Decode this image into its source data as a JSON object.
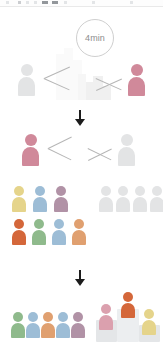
{
  "meta": {
    "background": "#ffffff"
  },
  "toolbar": {
    "visible": true,
    "label": ""
  },
  "palette": {
    "gray_person": "#e3e4e5",
    "gray_person_mid": "#dcdddf",
    "pink": "#d0899a",
    "pink_soft": "#dba0ae",
    "yellow": "#e5d48b",
    "blue": "#9dbdd6",
    "mauve": "#b192a6",
    "orange": "#d4673a",
    "orange_soft": "#de8f55",
    "green": "#8fba8c",
    "tan": "#e0a070",
    "line": "#b6b6b6",
    "arrow": "#1c1c1c",
    "circle_stroke": "#cfcfcf",
    "circle_text": "#8d8d8d",
    "skyline": "#e4e4e4",
    "podium": "#e2e4e6"
  },
  "tier_one": {
    "name": "opening-matchup",
    "timer": {
      "label": "4min",
      "x": 76,
      "y": 19,
      "size": 38
    },
    "left_player": {
      "color": "#e3e4e5",
      "x": 18,
      "y": 64,
      "label": "player-gray"
    },
    "right_player": {
      "color": "#d0899a",
      "x": 128,
      "y": 64,
      "label": "player-pink"
    },
    "skyline": {
      "x": 56,
      "y": 44,
      "blocks": [
        {
          "x": 0,
          "y": 0,
          "w": 8,
          "h": 46,
          "tone": "palest"
        },
        {
          "x": 8,
          "y": 0,
          "w": 9,
          "h": 52,
          "tone": "palest"
        },
        {
          "x": 17,
          "y": 0,
          "w": 9,
          "h": 40,
          "tone": "palest"
        },
        {
          "x": 22,
          "y": 0,
          "w": 8,
          "h": 26,
          "tone": "pale"
        },
        {
          "x": 30,
          "y": 0,
          "w": 7,
          "h": 18,
          "tone": ""
        },
        {
          "x": 37,
          "y": 0,
          "w": 10,
          "h": 24,
          "tone": ""
        },
        {
          "x": 47,
          "y": 0,
          "w": 8,
          "h": 14,
          "tone": ""
        }
      ]
    }
  },
  "arrow_one": {
    "name": "flow-arrow-1",
    "x": 74,
    "y": 110
  },
  "tier_two": {
    "name": "second-round-matchup",
    "left_player": {
      "color": "#d0899a",
      "x": 22,
      "y": 134,
      "label": "player-pink"
    },
    "right_player": {
      "color": "#e3e4e5",
      "x": 118,
      "y": 134,
      "label": "player-gray"
    }
  },
  "squads": {
    "name": "team-rosters",
    "left": {
      "label": "colored-squad",
      "rows": [
        {
          "y": 186,
          "x": 12,
          "gap": 21,
          "people": [
            {
              "color": "#e5d48b",
              "label": "teammate-yellow"
            },
            {
              "color": "#9dbdd6",
              "label": "teammate-blue"
            },
            {
              "color": "#b192a6",
              "label": "teammate-mauve"
            }
          ]
        },
        {
          "y": 219,
          "x": 12,
          "gap": 20,
          "people": [
            {
              "color": "#d4673a",
              "label": "teammate-orange"
            },
            {
              "color": "#8fba8c",
              "label": "teammate-green"
            },
            {
              "color": "#9dbdd6",
              "label": "teammate-blue"
            },
            {
              "color": "#e0a070",
              "label": "teammate-tan"
            }
          ]
        }
      ]
    },
    "right": {
      "label": "gray-squad",
      "rows": [
        {
          "y": 186,
          "x": 99,
          "gap": 17,
          "people": [
            {
              "color": "#e3e4e5",
              "label": "teammate-gray"
            },
            {
              "color": "#e3e4e5",
              "label": "teammate-gray"
            },
            {
              "color": "#e3e4e5",
              "label": "teammate-gray"
            },
            {
              "color": "#e3e4e5",
              "label": "teammate-gray"
            }
          ]
        }
      ]
    }
  },
  "arrow_two": {
    "name": "flow-arrow-2",
    "x": 74,
    "y": 270
  },
  "finale": {
    "name": "results",
    "lineup": {
      "label": "finalist-lineup",
      "x": 11,
      "y": 312,
      "gap": 15,
      "people": [
        {
          "color": "#8fba8c",
          "label": "finalist-green"
        },
        {
          "color": "#9dbdd6",
          "label": "finalist-blue"
        },
        {
          "color": "#e0a070",
          "label": "finalist-orange"
        },
        {
          "color": "#9dbdd6",
          "label": "finalist-blue"
        },
        {
          "color": "#b192a6",
          "label": "finalist-mauve"
        }
      ]
    },
    "podium": {
      "label": "winners-podium",
      "x": 96,
      "y": 290,
      "w": 64,
      "h": 52,
      "steps": [
        {
          "place": "2",
          "x": 0,
          "w": 21,
          "h": 22,
          "tone": "second"
        },
        {
          "place": "1",
          "x": 21,
          "w": 22,
          "h": 33,
          "tone": "first"
        },
        {
          "place": "3",
          "x": 43,
          "w": 21,
          "h": 17,
          "tone": "third"
        }
      ],
      "winners": [
        {
          "place": "2",
          "color": "#dba0ae",
          "x": 3,
          "y": 14,
          "label": "runner-up-pink"
        },
        {
          "place": "1",
          "color": "#d4673a",
          "x": 25,
          "y": 2,
          "label": "champion-orange"
        },
        {
          "place": "3",
          "color": "#e5d48b",
          "x": 46,
          "y": 19,
          "label": "third-place-yellow"
        }
      ]
    }
  }
}
